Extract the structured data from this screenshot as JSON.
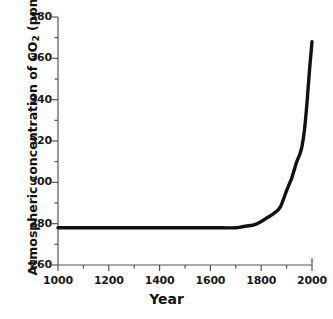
{
  "chart_data": {
    "type": "line",
    "title": "",
    "xlabel": "Year",
    "ylabel_prefix": "Atmospheric concentration of CO",
    "ylabel_sub": "2",
    "ylabel_suffix": " (ppm)",
    "ylabel_full": "Atmospheric concentration of CO2 (ppm)",
    "xlim": [
      1000,
      2000
    ],
    "ylim": [
      260,
      380
    ],
    "x_major_ticks": [
      1000,
      1200,
      1400,
      1600,
      1800,
      2000
    ],
    "x_minor_ticks": [
      1100,
      1300,
      1500,
      1700,
      1900
    ],
    "x_tick_labels": [
      "1000",
      "1200",
      "1400",
      "1600",
      "1800",
      "2000"
    ],
    "y_major_ticks": [
      260,
      280,
      300,
      320,
      340,
      360,
      380
    ],
    "y_minor_ticks": [
      270,
      290,
      310,
      330,
      350,
      370
    ],
    "y_tick_labels": [
      "260",
      "280",
      "300",
      "320",
      "340",
      "360",
      "380"
    ],
    "grid": false,
    "legend": false,
    "line_color": "#111111",
    "line_width_px": 3.4,
    "axis_color": "#555555",
    "background": "#ffffff",
    "series": [
      {
        "name": "Atmospheric CO2",
        "x": [
          1000,
          1050,
          1100,
          1150,
          1200,
          1250,
          1300,
          1350,
          1400,
          1450,
          1500,
          1550,
          1600,
          1650,
          1700,
          1725,
          1750,
          1775,
          1800,
          1825,
          1850,
          1875,
          1900,
          1910,
          1920,
          1930,
          1940,
          1950,
          1960,
          1970,
          1980,
          1990,
          2000
        ],
        "values": [
          278,
          278,
          278,
          278,
          278,
          278,
          278,
          278,
          278,
          278,
          278,
          278,
          278,
          278,
          278,
          278.5,
          279,
          279.5,
          281,
          283,
          285,
          288,
          296,
          299,
          302,
          306,
          310,
          313,
          317,
          325,
          338,
          354,
          368
        ]
      }
    ]
  }
}
